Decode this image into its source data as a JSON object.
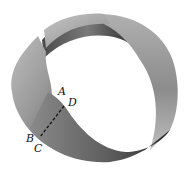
{
  "figure": {
    "labels": {
      "a": "A",
      "b": "B",
      "c": "C",
      "d": "D"
    },
    "cut_line_style": "dashed",
    "colors": {
      "background": "#ffffff",
      "strip_light": "#c8c8c8",
      "strip_mid": "#8a8a8a",
      "strip_dark": "#3a3a3a",
      "label": "#111111"
    }
  }
}
